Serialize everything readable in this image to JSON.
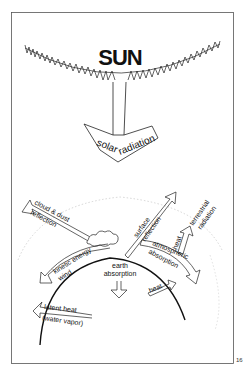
{
  "title": "SUN",
  "incoming": {
    "line1": "solar",
    "line2": "radiation"
  },
  "labels": {
    "cloud_dust": "cloud & dust",
    "reflection": "reflection",
    "kinetic_energy": "kinetic energy",
    "wind": "wind",
    "latent_heat": "latent heat",
    "water_vapor": "(water vapor)",
    "earth": "earth",
    "absorption": "absorption",
    "surface": "surface",
    "surface_reflection": "reflection",
    "heat_terrestrial": "heat",
    "terrestrial": "terrestrial",
    "radiation": "radiation",
    "atmospheric": "atmospheric",
    "atm_absorption": "absorption",
    "heat": "heat"
  },
  "page_number": "16"
}
